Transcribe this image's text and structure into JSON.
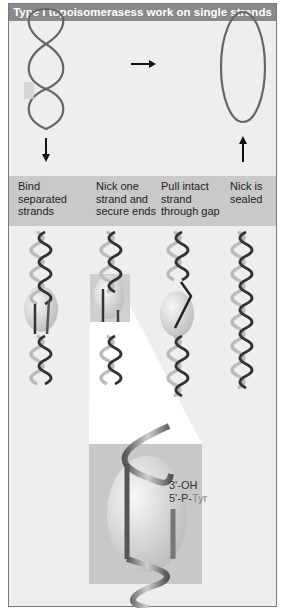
{
  "figure": {
    "title": "Type I topoisomerasess work on single strands",
    "colors": {
      "title_bar": "#8a8a8a",
      "panel_background": "#eeeeee",
      "caption_band": "#c9c9c9",
      "strand_dark": "#3a3a3a",
      "strand_light": "#b5b5b5",
      "enzyme": "#d8d8d8",
      "zoom_box": "#c8c8c8"
    },
    "top_row": {
      "left_diagram": "supercoiled-figure-eight-loop",
      "right_diagram": "relaxed-circle-loop",
      "arrow_between": "right-arrow",
      "left_arrow": "down-arrow",
      "right_arrow": "up-arrow"
    },
    "steps": [
      {
        "label": "Bind separated strands",
        "lines": [
          "Bind",
          "separated",
          "strands"
        ]
      },
      {
        "label": "Nick one strand and secure ends",
        "lines": [
          "Nick one",
          "strand and",
          "secure ends"
        ]
      },
      {
        "label": "Pull intact strand through gap",
        "lines": [
          "Pull intact",
          "strand",
          "through gap"
        ]
      },
      {
        "label": "Nick is sealed",
        "lines": [
          "Nick is",
          "sealed"
        ]
      }
    ],
    "zoom_inset": {
      "labels": {
        "oh": "3'-OH",
        "p_prefix": "5'-P-",
        "tyr": "Tyr"
      }
    }
  }
}
